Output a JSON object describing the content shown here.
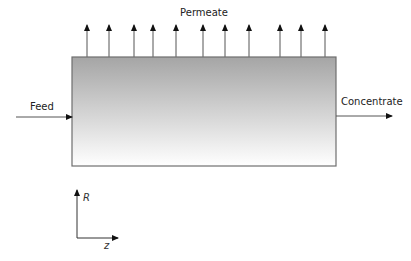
{
  "diagram": {
    "labels": {
      "permeate": "Permeate",
      "feed": "Feed",
      "concentrate": "Concentrate",
      "axis_r": "R",
      "axis_z": "z"
    },
    "membrane_module": {
      "x": 72,
      "y": 57,
      "width": 264,
      "height": 109,
      "gradient_top": "#a5a5a5",
      "gradient_bottom": "#ffffff",
      "border": "#6e6e6e"
    },
    "permeate_arrow_x": [
      87,
      109,
      134,
      153,
      176,
      203,
      225,
      249,
      280,
      301,
      325
    ],
    "stroke_color": "#111111"
  }
}
